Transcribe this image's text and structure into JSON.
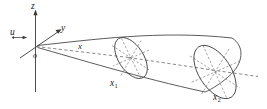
{
  "figure": {
    "name": "3d-coordinate-horn-diagram",
    "type": "technical-line-diagram",
    "background_color": "#ffffff",
    "line_color": "#3f3f3f",
    "dash_color": "#6a6a6a",
    "label_color": "#1c1c1c",
    "width": 267,
    "height": 109,
    "axes": [
      {
        "id": "z",
        "label": "z",
        "direction": "up",
        "style": "solid-arrow"
      },
      {
        "id": "y",
        "label": "y",
        "direction": "up-right",
        "style": "solid-arrow"
      },
      {
        "id": "u",
        "label": "u",
        "direction": "right",
        "style": "solid-arrow"
      },
      {
        "id": "x",
        "label": "x",
        "direction": "right-depth",
        "style": "dashed"
      }
    ],
    "origin": {
      "label": "o"
    },
    "cross_sections": [
      {
        "id": "section-1",
        "label": "x",
        "subscript": "1",
        "spokes": 4,
        "style": "dashed-spokes"
      },
      {
        "id": "section-2",
        "label": "x",
        "subscript": "2",
        "spokes": 4,
        "style": "dashed-spokes"
      }
    ],
    "labels": {
      "z": "z",
      "y": "y",
      "u": "u",
      "origin": "o",
      "x_axis": "x",
      "x1_base": "x",
      "x1_sub": "1",
      "x2_base": "x",
      "x2_sub": "2"
    }
  }
}
